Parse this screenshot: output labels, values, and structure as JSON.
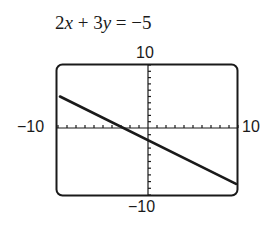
{
  "chart_data": {
    "type": "line",
    "title": "2x + 3y = −5",
    "equation": "2x + 3y = −5",
    "xlim": [
      -10,
      10
    ],
    "ylim": [
      -10,
      10
    ],
    "x_tick_labels": [
      "−10",
      "10"
    ],
    "y_tick_labels": [
      "10",
      "−10"
    ],
    "tick_step": 1,
    "grid": false,
    "series": [
      {
        "name": "2x + 3y = −5",
        "x": [
          -10,
          10
        ],
        "y": [
          5,
          -8.33
        ]
      }
    ],
    "xlabel": "",
    "ylabel": ""
  },
  "labels": {
    "title_parts": [
      "2",
      "x",
      " + 3",
      "y",
      " =  −5"
    ],
    "y_max": "10",
    "y_min": "−10",
    "x_min": "−10",
    "x_max": "10"
  },
  "colors": {
    "line": "#1a1a1a",
    "frame": "#1a1a1a"
  }
}
